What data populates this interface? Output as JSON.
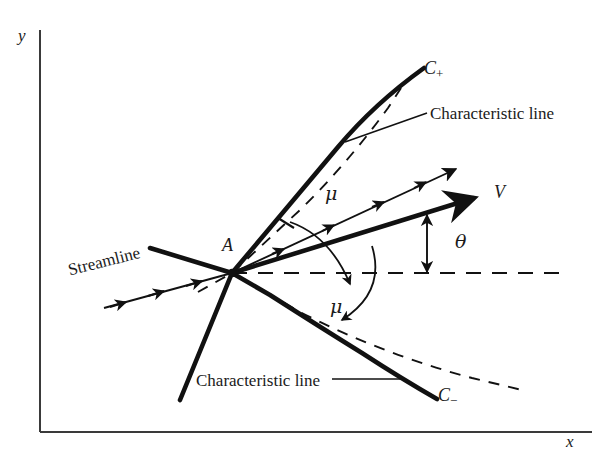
{
  "figure": {
    "kind": "technical-diagram",
    "background_color": "#ffffff",
    "ink_color": "#111111",
    "width": 609,
    "height": 462
  },
  "axes": {
    "y_label": "y",
    "x_label": "x",
    "origin": {
      "x": 40,
      "y": 432
    },
    "y_top": {
      "x": 40,
      "y": 30
    },
    "x_right": {
      "x": 592,
      "y": 432
    }
  },
  "point": {
    "label": "A",
    "x": 232,
    "y": 273
  },
  "labels": {
    "c_plus": {
      "base": "C",
      "subscript": "+",
      "full": "C+"
    },
    "c_minus": {
      "base": "C",
      "subscript": "−",
      "full": "C−"
    },
    "velocity": "V",
    "mach_angle_upper": "μ",
    "mach_angle_lower": "μ",
    "flow_angle": "θ",
    "characteristic_line_upper": "Characteristic line",
    "characteristic_line_lower": "Characteristic line",
    "streamline": "Streamline"
  },
  "geometry": {
    "c_plus_curve": "M 232 273 L 262 237 Q 300 192 336 149 Q 372 106 424 68",
    "c_plus_back_tail": "M 232 273 L 150 249",
    "c_plus_dashed_tangent": "M 196 290 L 232 273 L 300 210 Q 345 166 386 110 L 400 90",
    "c_minus_curve": "M 232 273 L 268 294 Q 318 326 360 352 Q 400 378 436 398",
    "c_minus_back_tail": "M 232 273 L 180 398",
    "c_minus_dashed_tangent": "M 232 273 L 300 312 Q 380 352 470 378 L 520 390",
    "velocity_vector": "M 232 273 L 480 196",
    "upper_streamline": "M 232 273 L 458 168",
    "incoming_streamline": "M 108 305 L 232 273",
    "horizontal_dashed": "M 232 273 L 566 273",
    "mu_upper_arc": "M 288 212 A 86 86 0 0 1 352 262",
    "mu_lower_arc": "M 372 246 A 105 105 0 0 1 342 316",
    "theta_arc_top": {
      "x": 425,
      "y": 212
    },
    "theta_arc_bottom": {
      "x": 425,
      "y": 273
    },
    "leader_upper": "M 344 143 L 424 112",
    "leader_lower": "M 330 379 L 404 379"
  },
  "streamline_arrow_count": 3,
  "upper_streamline_arrow_count": 4,
  "velocity_arrow_count": 1
}
